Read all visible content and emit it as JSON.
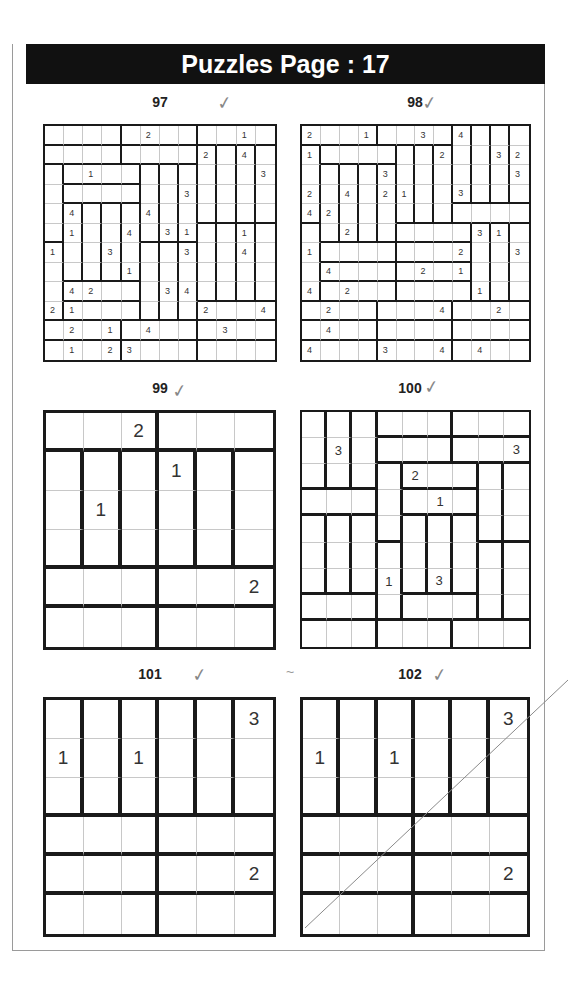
{
  "header": {
    "title": "Puzzles Page :  17"
  },
  "marks": {
    "tilde": "~"
  },
  "puzzles": [
    {
      "number": "97",
      "size": 12,
      "checked": true,
      "regions": [
        [
          "A",
          "A",
          "A",
          "A",
          "B",
          "B",
          "B",
          "B",
          "C",
          "C",
          "C",
          "C"
        ],
        [
          "D",
          "D",
          "D",
          "D",
          "E",
          "E",
          "E",
          "E",
          "F",
          "G",
          "H",
          "I"
        ],
        [
          "J",
          "K",
          "K",
          "K",
          "K",
          "L",
          "M",
          "N",
          "F",
          "G",
          "H",
          "I"
        ],
        [
          "J",
          "O",
          "O",
          "O",
          "O",
          "L",
          "M",
          "N",
          "F",
          "G",
          "H",
          "I"
        ],
        [
          "J",
          "P",
          "Q",
          "R",
          "S",
          "L",
          "M",
          "N",
          "F",
          "G",
          "H",
          "I"
        ],
        [
          "J",
          "P",
          "Q",
          "R",
          "S",
          "L",
          "M",
          "N",
          "T",
          "U",
          "V",
          "W"
        ],
        [
          "X",
          "P",
          "Q",
          "R",
          "S",
          "Y",
          "Z",
          "AA",
          "T",
          "U",
          "V",
          "W"
        ],
        [
          "X",
          "P",
          "Q",
          "R",
          "S",
          "Y",
          "Z",
          "AA",
          "T",
          "U",
          "V",
          "W"
        ],
        [
          "X",
          "AB",
          "AB",
          "AB",
          "AB",
          "Y",
          "Z",
          "AA",
          "T",
          "U",
          "V",
          "W"
        ],
        [
          "X",
          "AC",
          "AC",
          "AC",
          "AC",
          "Y",
          "Z",
          "AA",
          "AD",
          "AD",
          "AD",
          "AD"
        ],
        [
          "AE",
          "AE",
          "AE",
          "AE",
          "AF",
          "AF",
          "AF",
          "AF",
          "AG",
          "AG",
          "AG",
          "AG"
        ],
        [
          "AH",
          "AH",
          "AH",
          "AH",
          "AI",
          "AI",
          "AI",
          "AI",
          "AJ",
          "AJ",
          "AJ",
          "AJ"
        ]
      ],
      "values": [
        [
          "",
          "",
          "",
          "",
          "",
          "2",
          "",
          "",
          "",
          "",
          "1",
          ""
        ],
        [
          "",
          "",
          "",
          "",
          "",
          "",
          "",
          "",
          "2",
          "",
          "4",
          ""
        ],
        [
          "",
          "",
          "1",
          "",
          "",
          "",
          "",
          "",
          "",
          "",
          "",
          "3"
        ],
        [
          "",
          "",
          "",
          "",
          "",
          "",
          "",
          "3",
          "",
          "",
          "",
          ""
        ],
        [
          "",
          "4",
          "",
          "",
          "",
          "4",
          "",
          "",
          "",
          "",
          "",
          ""
        ],
        [
          "",
          "1",
          "",
          "",
          "4",
          "",
          "3",
          "1",
          "",
          "",
          "1",
          ""
        ],
        [
          "1",
          "",
          "",
          "3",
          "",
          "",
          "",
          "3",
          "",
          "",
          "4",
          ""
        ],
        [
          "",
          "",
          "",
          "",
          "1",
          "",
          "",
          "",
          "",
          "",
          "",
          ""
        ],
        [
          "",
          "4",
          "2",
          "",
          "",
          "",
          "3",
          "4",
          "",
          "",
          "",
          ""
        ],
        [
          "2",
          "1",
          "",
          "",
          "",
          "",
          "",
          "",
          "2",
          "",
          "",
          "4"
        ],
        [
          "",
          "2",
          "",
          "1",
          "",
          "4",
          "",
          "",
          "",
          "3",
          "",
          ""
        ],
        [
          "",
          "1",
          "",
          "2",
          "3",
          "",
          "",
          "",
          "",
          "",
          "",
          ""
        ]
      ]
    },
    {
      "number": "98",
      "size": 12,
      "checked": true,
      "regions": [
        [
          "A",
          "A",
          "A",
          "A",
          "B",
          "B",
          "B",
          "B",
          "C",
          "D",
          "E",
          "F"
        ],
        [
          "G",
          "H",
          "H",
          "H",
          "H",
          "I",
          "J",
          "K",
          "C",
          "D",
          "E",
          "F"
        ],
        [
          "G",
          "L",
          "M",
          "N",
          "O",
          "I",
          "J",
          "K",
          "C",
          "D",
          "E",
          "F"
        ],
        [
          "G",
          "L",
          "M",
          "N",
          "O",
          "I",
          "J",
          "K",
          "C",
          "D",
          "E",
          "F"
        ],
        [
          "G",
          "L",
          "M",
          "N",
          "O",
          "I",
          "J",
          "K",
          "P",
          "P",
          "P",
          "P"
        ],
        [
          "Q",
          "L",
          "M",
          "N",
          "O",
          "R",
          "R",
          "R",
          "R",
          "S",
          "T",
          "U"
        ],
        [
          "Q",
          "V",
          "V",
          "V",
          "V",
          "W",
          "W",
          "W",
          "W",
          "S",
          "T",
          "U"
        ],
        [
          "Q",
          "X",
          "X",
          "X",
          "X",
          "Y",
          "Y",
          "Y",
          "Y",
          "S",
          "T",
          "U"
        ],
        [
          "Q",
          "Z",
          "Z",
          "Z",
          "Z",
          "AA",
          "AA",
          "AA",
          "AA",
          "S",
          "T",
          "U"
        ],
        [
          "AB",
          "AB",
          "AB",
          "AB",
          "AC",
          "AC",
          "AC",
          "AC",
          "AD",
          "AD",
          "AD",
          "AD"
        ],
        [
          "AE",
          "AE",
          "AE",
          "AE",
          "AF",
          "AF",
          "AF",
          "AF",
          "AG",
          "AG",
          "AG",
          "AG"
        ],
        [
          "AH",
          "AH",
          "AH",
          "AH",
          "AI",
          "AI",
          "AI",
          "AI",
          "AJ",
          "AJ",
          "AJ",
          "AJ"
        ]
      ],
      "values": [
        [
          "2",
          "",
          "",
          "1",
          "",
          "",
          "3",
          "",
          "4",
          "",
          "",
          ""
        ],
        [
          "1",
          "",
          "",
          "",
          "",
          "",
          "",
          "2",
          "",
          "",
          "3",
          "2"
        ],
        [
          "",
          "",
          "",
          "",
          "3",
          "",
          "",
          "",
          "",
          "",
          "",
          "3"
        ],
        [
          "2",
          "",
          "4",
          "",
          "2",
          "1",
          "",
          "",
          "3",
          "",
          "",
          ""
        ],
        [
          "4",
          "2",
          "",
          "",
          "",
          "",
          "",
          "",
          "",
          "",
          "",
          ""
        ],
        [
          "",
          "",
          "2",
          "",
          "",
          "",
          "",
          "",
          "",
          "3",
          "1",
          ""
        ],
        [
          "1",
          "",
          "",
          "",
          "",
          "",
          "",
          "",
          "2",
          "",
          "",
          "3"
        ],
        [
          "",
          "4",
          "",
          "",
          "",
          "",
          "2",
          "",
          "1",
          "",
          "",
          ""
        ],
        [
          "4",
          "",
          "2",
          "",
          "",
          "",
          "",
          "",
          "",
          "1",
          "",
          ""
        ],
        [
          "",
          "2",
          "",
          "",
          "",
          "",
          "",
          "4",
          "",
          "",
          "2",
          ""
        ],
        [
          "",
          "4",
          "",
          "",
          "",
          "",
          "",
          "",
          "",
          "",
          "",
          ""
        ],
        [
          "4",
          "",
          "",
          "",
          "3",
          "",
          "",
          "4",
          "",
          "4",
          "",
          ""
        ]
      ]
    },
    {
      "number": "99",
      "size": 6,
      "checked": true,
      "regions": [
        [
          "A",
          "A",
          "A",
          "B",
          "B",
          "B"
        ],
        [
          "C",
          "D",
          "E",
          "F",
          "G",
          "H"
        ],
        [
          "C",
          "D",
          "E",
          "F",
          "G",
          "H"
        ],
        [
          "C",
          "D",
          "E",
          "F",
          "G",
          "H"
        ],
        [
          "I",
          "I",
          "I",
          "J",
          "J",
          "J"
        ],
        [
          "K",
          "K",
          "K",
          "L",
          "L",
          "L"
        ]
      ],
      "values": [
        [
          "",
          "",
          "2",
          "",
          "",
          ""
        ],
        [
          "",
          "",
          "",
          "1",
          "",
          ""
        ],
        [
          "",
          "1",
          "",
          "",
          "",
          ""
        ],
        [
          "",
          "",
          "",
          "",
          "",
          ""
        ],
        [
          "",
          "",
          "",
          "",
          "",
          "2"
        ],
        [
          "",
          "",
          "",
          "",
          "",
          ""
        ]
      ]
    },
    {
      "number": "100",
      "size": 9,
      "checked": true,
      "regions": [
        [
          "A",
          "B",
          "C",
          "D",
          "D",
          "D",
          "E",
          "E",
          "E"
        ],
        [
          "A",
          "B",
          "C",
          "F",
          "F",
          "F",
          "G",
          "G",
          "G"
        ],
        [
          "A",
          "B",
          "C",
          "H",
          "I",
          "I",
          "I",
          "J",
          "K"
        ],
        [
          "L",
          "L",
          "L",
          "H",
          "M",
          "M",
          "M",
          "J",
          "K"
        ],
        [
          "N",
          "O",
          "P",
          "H",
          "Q",
          "R",
          "S",
          "J",
          "K"
        ],
        [
          "N",
          "O",
          "P",
          "T",
          "Q",
          "R",
          "S",
          "U",
          "V"
        ],
        [
          "N",
          "O",
          "P",
          "T",
          "Q",
          "R",
          "S",
          "U",
          "V"
        ],
        [
          "W",
          "W",
          "W",
          "T",
          "X",
          "X",
          "X",
          "U",
          "V"
        ],
        [
          "Y",
          "Y",
          "Y",
          "Z",
          "Z",
          "Z",
          "AA",
          "AA",
          "AA"
        ]
      ],
      "values": [
        [
          "",
          "",
          "",
          "",
          "",
          "",
          "",
          "",
          ""
        ],
        [
          "",
          "3",
          "",
          "",
          "",
          "",
          "",
          "",
          "3"
        ],
        [
          "",
          "",
          "",
          "",
          "2",
          "",
          "",
          "",
          ""
        ],
        [
          "",
          "",
          "",
          "",
          "",
          "1",
          "",
          "",
          ""
        ],
        [
          "",
          "",
          "",
          "",
          "",
          "",
          "",
          "",
          ""
        ],
        [
          "",
          "",
          "",
          "",
          "",
          "",
          "",
          "",
          ""
        ],
        [
          "",
          "",
          "",
          "1",
          "",
          "3",
          "",
          "",
          ""
        ],
        [
          "",
          "",
          "",
          "",
          "",
          "",
          "",
          "",
          ""
        ],
        [
          "",
          "",
          "",
          "",
          "",
          "",
          "",
          "",
          ""
        ]
      ]
    },
    {
      "number": "101",
      "size": 6,
      "checked": true,
      "regions": [
        [
          "A",
          "B",
          "C",
          "D",
          "E",
          "F"
        ],
        [
          "A",
          "B",
          "C",
          "D",
          "E",
          "F"
        ],
        [
          "A",
          "B",
          "C",
          "D",
          "E",
          "F"
        ],
        [
          "G",
          "G",
          "G",
          "H",
          "H",
          "H"
        ],
        [
          "I",
          "I",
          "I",
          "J",
          "J",
          "J"
        ],
        [
          "K",
          "K",
          "K",
          "L",
          "L",
          "L"
        ]
      ],
      "values": [
        [
          "",
          "",
          "",
          "",
          "",
          "3"
        ],
        [
          "1",
          "",
          "1",
          "",
          "",
          ""
        ],
        [
          "",
          "",
          "",
          "",
          "",
          ""
        ],
        [
          "",
          "",
          "",
          "",
          "",
          ""
        ],
        [
          "",
          "",
          "",
          "",
          "",
          "2"
        ],
        [
          "",
          "",
          "",
          "",
          "",
          ""
        ]
      ]
    },
    {
      "number": "102",
      "size": 6,
      "checked": true,
      "regions": [
        [
          "A",
          "B",
          "C",
          "D",
          "E",
          "F"
        ],
        [
          "A",
          "B",
          "C",
          "D",
          "E",
          "F"
        ],
        [
          "A",
          "B",
          "C",
          "D",
          "E",
          "F"
        ],
        [
          "G",
          "G",
          "G",
          "H",
          "H",
          "H"
        ],
        [
          "I",
          "I",
          "I",
          "J",
          "J",
          "J"
        ],
        [
          "K",
          "K",
          "K",
          "L",
          "L",
          "L"
        ]
      ],
      "values": [
        [
          "",
          "",
          "",
          "",
          "",
          "3"
        ],
        [
          "1",
          "",
          "1",
          "",
          "",
          ""
        ],
        [
          "",
          "",
          "",
          "",
          "",
          ""
        ],
        [
          "",
          "",
          "",
          "",
          "",
          ""
        ],
        [
          "",
          "",
          "",
          "",
          "",
          "2"
        ],
        [
          "",
          "",
          "",
          "",
          "",
          ""
        ]
      ]
    }
  ],
  "check_mark": "✓"
}
